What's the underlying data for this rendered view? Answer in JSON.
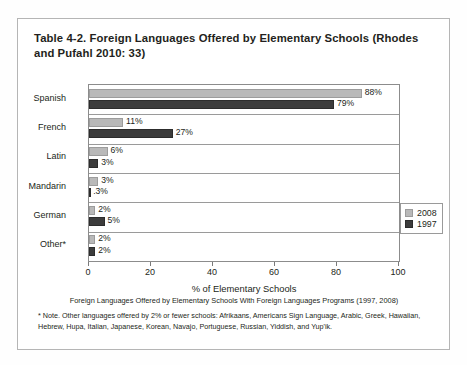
{
  "title": "Table 4-2. Foreign Languages Offered by Elementary Schools (Rhodes and Pufahl 2010: 33)",
  "caption": "Foreign Languages Offered by Elementary Schools With Foreign Languages Programs (1997, 2008)",
  "note": "* Note. Other languages offered by 2% or fewer schools: Afrikaans, Americans Sign Language, Arabic, Greek, Hawaiian, Hebrew, Hupa, Italian, Japanese, Korean, Navajo, Portuguese, Russian, Yiddish, and Yup'ik.",
  "legend": {
    "items": [
      {
        "label": "2008",
        "color": "#b9b9b9"
      },
      {
        "label": "1997",
        "color": "#3c3c3c"
      }
    ]
  },
  "chart_data": {
    "type": "bar",
    "orientation": "horizontal",
    "title": "Foreign Languages Offered by Elementary Schools With Foreign Languages Programs (1997, 2008)",
    "xlabel": "% of Elementary Schools",
    "ylabel": "Language Offered",
    "xlim": [
      0,
      100
    ],
    "xticks": [
      0,
      20,
      40,
      60,
      80,
      100
    ],
    "grid": false,
    "legend_position": "right",
    "categories": [
      "Spanish",
      "French",
      "Latin",
      "Mandarin",
      "German",
      "Other*"
    ],
    "series": [
      {
        "name": "2008",
        "color": "#b9b9b9",
        "values": [
          88,
          11,
          6,
          3,
          2,
          2
        ],
        "labels": [
          "88%",
          "11%",
          "6%",
          "3%",
          "2%",
          "2%"
        ]
      },
      {
        "name": "1997",
        "color": "#3c3c3c",
        "values": [
          79,
          27,
          3,
          0.3,
          5,
          2
        ],
        "labels": [
          "79%",
          "27%",
          "3%",
          ".3%",
          "5%",
          "2%"
        ]
      }
    ]
  }
}
